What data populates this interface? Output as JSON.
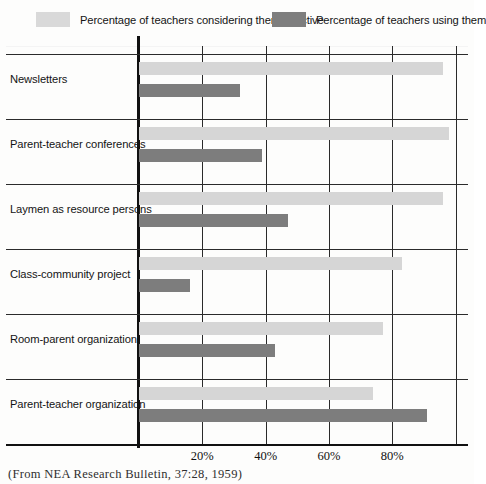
{
  "legend": {
    "entries": [
      {
        "label": "Percentage of teachers considering them effective",
        "swatch": "light-grey-swatch-icon",
        "color": "#d9d9d9"
      },
      {
        "label": "Percentage of teachers using them",
        "swatch": "dark-grey-swatch-icon",
        "color": "#7e7e7e"
      }
    ]
  },
  "axis": {
    "x_ticks": [
      "20%",
      "40%",
      "60%",
      "80%"
    ],
    "x_tick_values": [
      20,
      40,
      60,
      80
    ]
  },
  "caption": {
    "text": "(From NEA Research Bulletin, 37:28, 1959)"
  },
  "chart_data": {
    "type": "bar",
    "orientation": "horizontal",
    "title": "",
    "subtitle": "",
    "xlabel": "",
    "ylabel": "",
    "xlim": [
      0,
      100
    ],
    "grid": true,
    "legend_position": "top",
    "categories": [
      "Newsletters",
      "Parent-teacher conferences",
      "Laymen as resource persons",
      "Class-community project",
      "Room-parent organization",
      "Parent-teacher organization"
    ],
    "series": [
      {
        "name": "Percentage of teachers considering them effective",
        "color": "#d6d6d6",
        "values": [
          96,
          98,
          96,
          83,
          77,
          74
        ]
      },
      {
        "name": "Percentage of teachers using them",
        "color": "#7d7d7d",
        "values": [
          32,
          39,
          47,
          16,
          43,
          91
        ]
      }
    ]
  }
}
